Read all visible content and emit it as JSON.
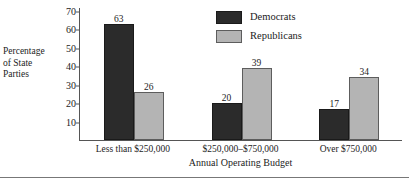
{
  "chart_data": {
    "type": "bar",
    "title": "",
    "xlabel": "Annual Operating Budget",
    "ylabel": "Percentage of State Parties",
    "ylabel_lines": [
      "Percentage",
      "of State",
      "Parties"
    ],
    "categories": [
      "Less than $250,000",
      "$250,000–$750,000",
      "Over $750,000"
    ],
    "series": [
      {
        "name": "Democrats",
        "color": "#2b2b2b",
        "values": [
          63,
          20,
          17
        ]
      },
      {
        "name": "Republicans",
        "color": "#b4b4b4",
        "values": [
          26,
          39,
          34
        ]
      }
    ],
    "yticks": [
      10,
      20,
      30,
      40,
      50,
      60,
      70
    ],
    "ytick_labels": [
      "10",
      "20",
      "30",
      "40",
      "50",
      "60",
      "70"
    ],
    "ylim": [
      0,
      72
    ],
    "grid": false,
    "legend_position": "top-right",
    "value_labels": {
      "group0": {
        "democrats": "63",
        "republicans": "26"
      },
      "group1": {
        "democrats": "20",
        "republicans": "39"
      },
      "group2": {
        "democrats": "17",
        "republicans": "34"
      }
    }
  },
  "legend": {
    "items": [
      {
        "label": "Democrats"
      },
      {
        "label": "Republicans"
      }
    ]
  }
}
